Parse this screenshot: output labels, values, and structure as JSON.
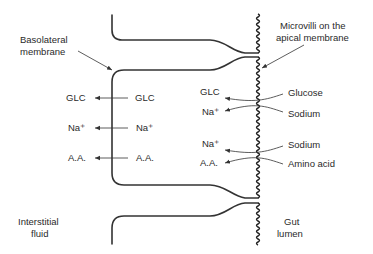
{
  "diagram": {
    "labels": {
      "basolateral": [
        "Basolateral",
        "membrane"
      ],
      "microvilli": [
        "Microvilli on the",
        "apical membrane"
      ],
      "interstitial": [
        "Interstitial",
        "fluid"
      ],
      "gut": [
        "Gut",
        "lumen"
      ]
    },
    "basolateral_transport": [
      {
        "inside": "GLC",
        "outside": "GLC"
      },
      {
        "inside": "Na⁺",
        "outside": "Na⁺"
      },
      {
        "inside": "A.A.",
        "outside": "A.A."
      }
    ],
    "apical_symport": [
      {
        "cell_labels": [
          "GLC",
          "Na⁺"
        ],
        "lumen_labels": [
          "Glucose",
          "Sodium"
        ]
      },
      {
        "cell_labels": [
          "Na⁺",
          "A.A."
        ],
        "lumen_labels": [
          "Sodium",
          "Amino acid"
        ]
      }
    ]
  }
}
